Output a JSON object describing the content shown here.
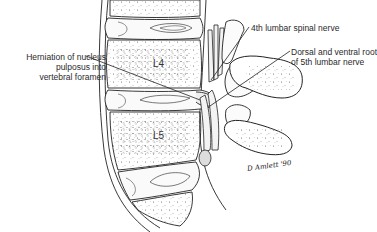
{
  "figure": {
    "labels": {
      "herniation": {
        "lines": [
          "Herniation of nucleus",
          "pulposus into",
          "vertebral foramen"
        ]
      },
      "nerve4": {
        "text": "4th lumbar spinal nerve"
      },
      "roots5": {
        "lines": [
          "Dorsal and ventral root",
          "of 5th lumbar nerve"
        ]
      }
    },
    "vertebra_labels": {
      "l4": "L4",
      "l5": "L5"
    },
    "signature": {
      "name": "D Amlett",
      "year": "'90"
    }
  }
}
